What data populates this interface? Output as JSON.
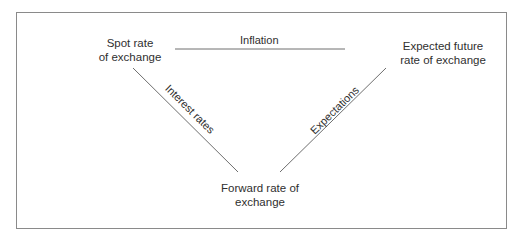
{
  "diagram": {
    "type": "triangle-relationship",
    "nodes": {
      "spot": {
        "line1": "Spot rate",
        "line2": "of exchange"
      },
      "expected": {
        "line1": "Expected future",
        "line2": "rate of exchange"
      },
      "forward": {
        "line1": "Forward rate of",
        "line2": "exchange"
      }
    },
    "edges": {
      "inflation": {
        "label": "Inflation",
        "from": "spot",
        "to": "expected"
      },
      "interest_rates": {
        "label": "Interest rates",
        "from": "spot",
        "to": "forward"
      },
      "expectations": {
        "label": "Expectations",
        "from": "forward",
        "to": "expected"
      }
    },
    "colors": {
      "line": "#6e6e6e",
      "text": "#2f2f2f",
      "border": "#8a8a8a"
    }
  }
}
